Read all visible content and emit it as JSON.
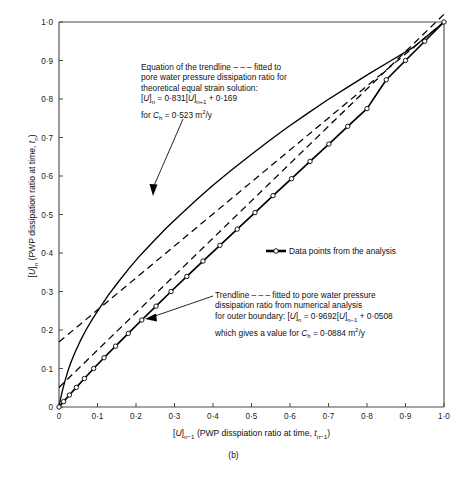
{
  "caption": "(b)",
  "chart_data": {
    "type": "line",
    "title": "",
    "xlabel": "[U]n-1 (PWP disspiation ratio at time, tn-1)",
    "ylabel": "[U]n (PWP dissipation ratio at time, tn)",
    "xlim": [
      0,
      1
    ],
    "ylim": [
      0,
      1
    ],
    "grid": false,
    "legend_position": "inside-right",
    "xticks": [
      "0",
      "0·1",
      "0·2",
      "0·3",
      "0·4",
      "0·5",
      "0·6",
      "0·7",
      "0·8",
      "0·9",
      "1·0"
    ],
    "xtick_values": [
      0,
      0.1,
      0.2,
      0.3,
      0.4,
      0.5,
      0.6,
      0.7,
      0.8,
      0.9,
      1.0
    ],
    "yticks": [
      "0",
      "0·1",
      "0·2",
      "0·3",
      "0·4",
      "0·5",
      "0·6",
      "0·7",
      "0·8",
      "0·9",
      "1·0"
    ],
    "ytick_values": [
      0,
      0.1,
      0.2,
      0.3,
      0.4,
      0.5,
      0.6,
      0.7,
      0.8,
      0.9,
      1.0
    ],
    "series": [
      {
        "name": "Theoretical equal strain solution",
        "style": "solid-line",
        "x": [
          0.0,
          0.004,
          0.009,
          0.015,
          0.022,
          0.031,
          0.042,
          0.055,
          0.07,
          0.088,
          0.108,
          0.13,
          0.155,
          0.182,
          0.212,
          0.245,
          0.28,
          0.318,
          0.358,
          0.4,
          0.445,
          0.492,
          0.54,
          0.59,
          0.642,
          0.695,
          0.75,
          0.806,
          0.863,
          0.92,
          0.96,
          1.0
        ],
        "y": [
          0.0,
          0.021,
          0.043,
          0.066,
          0.09,
          0.116,
          0.143,
          0.171,
          0.2,
          0.23,
          0.261,
          0.293,
          0.326,
          0.36,
          0.395,
          0.43,
          0.466,
          0.502,
          0.539,
          0.576,
          0.613,
          0.65,
          0.687,
          0.724,
          0.76,
          0.796,
          0.831,
          0.866,
          0.9,
          0.934,
          0.967,
          1.0
        ]
      },
      {
        "name": "Data points from the analysis",
        "style": "solid-line-with-open-circle-markers",
        "x": [
          0.0,
          0.012,
          0.027,
          0.045,
          0.066,
          0.09,
          0.117,
          0.147,
          0.18,
          0.215,
          0.252,
          0.291,
          0.332,
          0.374,
          0.418,
          0.463,
          0.509,
          0.556,
          0.604,
          0.652,
          0.701,
          0.75,
          0.8,
          0.85,
          0.9,
          0.95,
          1.0
        ],
        "y": [
          0.0,
          0.014,
          0.031,
          0.051,
          0.074,
          0.1,
          0.128,
          0.158,
          0.191,
          0.226,
          0.262,
          0.3,
          0.339,
          0.379,
          0.42,
          0.462,
          0.505,
          0.549,
          0.593,
          0.638,
          0.683,
          0.729,
          0.775,
          0.85,
          0.9,
          0.95,
          1.0
        ]
      },
      {
        "name": "Trendline for outer boundary (numerical analysis)",
        "style": "dashed-line",
        "equation_slope": 0.9692,
        "equation_intercept": 0.0508,
        "x": [
          0.0,
          1.0
        ],
        "y": [
          0.0508,
          1.02
        ]
      },
      {
        "name": "Trendline for theoretical equal strain solution",
        "style": "dashed-line",
        "equation_slope": 0.831,
        "equation_intercept": 0.169,
        "x": [
          0.0,
          1.0
        ],
        "y": [
          0.169,
          1.0
        ]
      }
    ],
    "annotations": [
      {
        "id": "theory-trendline-note",
        "lines": [
          "Equation of the trendline – – – fitted to",
          "pore water pressure dissipation ratio for",
          "theoretical equal strain solution:",
          "[U]n = 0·831[U]n+1 + 0·169",
          "for Ch = 0·523 m2/y"
        ],
        "points_to": [
          0.214,
          0.355
        ]
      },
      {
        "id": "outer-boundary-trendline-note",
        "lines": [
          "Trendline – – – fitted to pore water pressure",
          "dissipation ratio from numerical analysis",
          "for outer boundary: [U]n = 0·9692[U]n-1 + 0·0508",
          "which gives a value for Ch = 0·0884 m2/y"
        ],
        "points_to": [
          0.222,
          0.238
        ]
      }
    ],
    "legend": [
      {
        "label": "Data points from the analysis",
        "marker": "open-circle-on-line"
      }
    ]
  }
}
